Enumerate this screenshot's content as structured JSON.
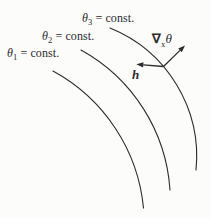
{
  "figure": {
    "background": "#fcfcfb",
    "line_color": "#2b2b2b",
    "curve_labels": [
      {
        "base": "θ",
        "sub": "1",
        "rest": " = const."
      },
      {
        "base": "θ",
        "sub": "2",
        "rest": " = const."
      },
      {
        "base": "θ",
        "sub": "3",
        "rest": " = const."
      }
    ],
    "gradient_label": {
      "base": "∇",
      "sub": "x",
      "rest": "θ"
    },
    "vector_label": "h"
  }
}
